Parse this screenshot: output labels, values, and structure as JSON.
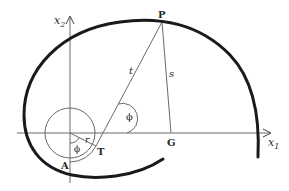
{
  "diagram": {
    "axes": {
      "x_label": "x",
      "x_sub": "1",
      "y_label": "x",
      "y_sub": "2"
    },
    "points": {
      "P": "P",
      "G": "G",
      "T": "T",
      "A": "A"
    },
    "segments": {
      "t": "t",
      "s": "s",
      "r": "r"
    },
    "angles": {
      "phi_at_T": "ϕ",
      "phi_at_origin": "ϕ"
    },
    "colors": {
      "curve": "#1a1a1a",
      "lines": "#6a6a6a",
      "text": "#2a2a2a"
    }
  }
}
